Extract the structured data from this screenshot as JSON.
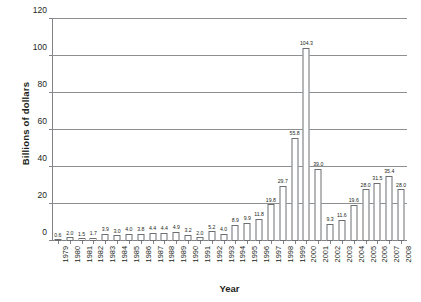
{
  "chart_data": {
    "type": "bar",
    "title": "",
    "xlabel": "Year",
    "ylabel": "Billions of dollars",
    "ylim": [
      0,
      120
    ],
    "yticks": [
      0,
      20,
      40,
      60,
      80,
      100,
      120
    ],
    "grid": true,
    "legend": false,
    "bar_color": "#ffffff",
    "bar_edge_color": "#6d6e71",
    "grid_color": "#8c8f92",
    "text_color": "#231f20",
    "categories": [
      "1979",
      "1980",
      "1981",
      "1982",
      "1983",
      "1984",
      "1985",
      "1986",
      "1987",
      "1988",
      "1989",
      "1990",
      "1991",
      "1992",
      "1993",
      "1994",
      "1995",
      "1996",
      "1997",
      "1998",
      "1999",
      "2000",
      "2001",
      "2002",
      "2003",
      "2004",
      "2005",
      "2006",
      "2007",
      "2008"
    ],
    "values": [
      0.6,
      2.0,
      1.5,
      1.7,
      3.9,
      3.0,
      4.0,
      3.8,
      4.4,
      4.4,
      4.9,
      3.2,
      2.0,
      5.2,
      4.0,
      8.9,
      9.9,
      11.8,
      19.8,
      29.7,
      55.8,
      104.3,
      39.0,
      9.3,
      11.6,
      19.6,
      28.0,
      31.5,
      35.4,
      28.0
    ],
    "value_labels": [
      "0.6",
      "2.0",
      "1.5",
      "1.7",
      "3.9",
      "3.0",
      "4.0",
      "3.8",
      "4.4",
      "4.4",
      "4.9",
      "3.2",
      "2.0",
      "5.2",
      "4.0",
      "8.9",
      "9.9",
      "11.8",
      "19.8",
      "29.7",
      "55.8",
      "104.3",
      "39.0",
      "9.3",
      "11.6",
      "19.6",
      "28.0",
      "31.5",
      "35.4",
      "28.0"
    ]
  }
}
